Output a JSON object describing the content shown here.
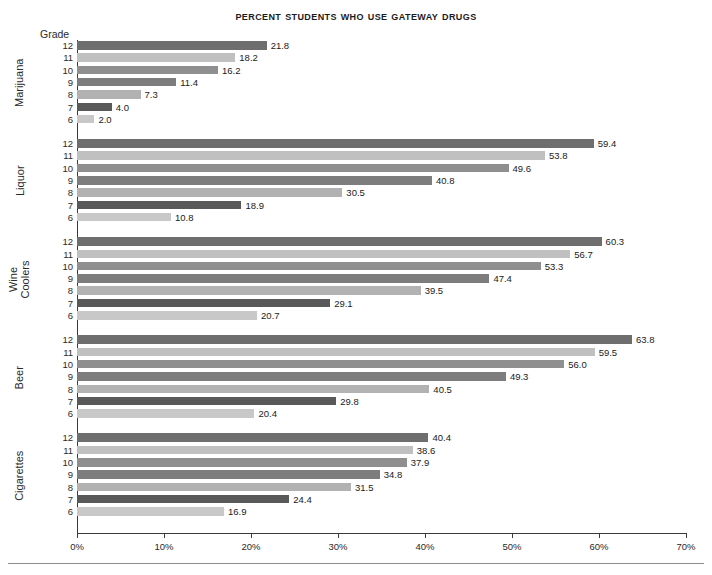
{
  "chart_data": {
    "type": "bar",
    "orientation": "horizontal",
    "title": "Percent Students Who Use Gateway Drugs",
    "xlabel": "",
    "ylabel": "Grade",
    "xlim": [
      0,
      70
    ],
    "xtick_labels": [
      "0%",
      "10%",
      "20%",
      "30%",
      "40%",
      "50%",
      "60%",
      "70%"
    ],
    "xtick_values": [
      0,
      10,
      20,
      30,
      40,
      50,
      60,
      70
    ],
    "grid": false,
    "legend": "none",
    "grade_header": "Grade",
    "grades": [
      "12",
      "11",
      "10",
      "9",
      "8",
      "7",
      "6"
    ],
    "groups": [
      {
        "name": "Marijuana",
        "label": "Marijuana",
        "values": [
          21.8,
          18.2,
          16.2,
          11.4,
          7.3,
          4.0,
          2.0
        ],
        "labels": [
          "21.8",
          "18.2",
          "16.2",
          "11.4",
          "7.3",
          "4.0",
          "2.0"
        ]
      },
      {
        "name": "Liquor",
        "label": "Liquor",
        "values": [
          59.4,
          53.8,
          49.6,
          40.8,
          30.5,
          18.9,
          10.8
        ],
        "labels": [
          "59.4",
          "53.8",
          "49.6",
          "40.8",
          "30.5",
          "18.9",
          "10.8"
        ]
      },
      {
        "name": "Wine Coolers",
        "label": "Wine\nCoolers",
        "values": [
          60.3,
          56.7,
          53.3,
          47.4,
          39.5,
          29.1,
          20.7
        ],
        "labels": [
          "60.3",
          "56.7",
          "53.3",
          "47.4",
          "39.5",
          "29.1",
          "20.7"
        ]
      },
      {
        "name": "Beer",
        "label": "Beer",
        "values": [
          63.8,
          59.5,
          56.0,
          49.3,
          40.5,
          29.8,
          20.4
        ],
        "labels": [
          "63.8",
          "59.5",
          "56.0",
          "49.3",
          "40.5",
          "29.8",
          "20.4"
        ]
      },
      {
        "name": "Cigarettes",
        "label": "Cigarettes",
        "values": [
          40.4,
          38.6,
          37.9,
          34.8,
          31.5,
          24.4,
          16.9
        ],
        "labels": [
          "40.4",
          "38.6",
          "37.9",
          "34.8",
          "31.5",
          "24.4",
          "16.9"
        ]
      }
    ],
    "grade_colors": {
      "12": "#6e6e6e",
      "11": "#c0c0c0",
      "10": "#8f8f8f",
      "9": "#7d7d7d",
      "8": "#b2b2b2",
      "7": "#595959",
      "6": "#c8c8c8"
    },
    "axis_color": "#3a3a3a",
    "text_color": "#1a1a1a",
    "background_color": "#ffffff"
  }
}
